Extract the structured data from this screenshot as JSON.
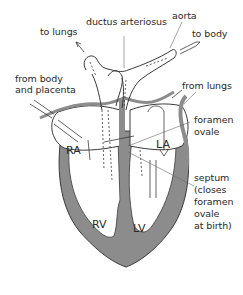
{
  "diagram": {
    "labels": {
      "to_lungs": "to lungs",
      "ductus_arteriosus": "ductus arteriosus",
      "aorta": "aorta",
      "to_body": "to body",
      "from_body_line1": "from body",
      "from_body_line2": "and placenta",
      "from_lungs": "from lungs",
      "foramen_ovale_line1": "foramen",
      "foramen_ovale_line2": "ovale",
      "septum_line1": "septum",
      "septum_line2": "(closes",
      "septum_line3": "foramen",
      "septum_line4": "ovale",
      "septum_line5": "at birth)"
    },
    "chambers": {
      "ra": "RA",
      "la": "LA",
      "rv": "RV",
      "lv": "LV"
    },
    "colors": {
      "wall": "#8c8c8c",
      "outline": "#3a3a3a",
      "interior": "#ffffff",
      "text": "#2a2a2a"
    }
  }
}
